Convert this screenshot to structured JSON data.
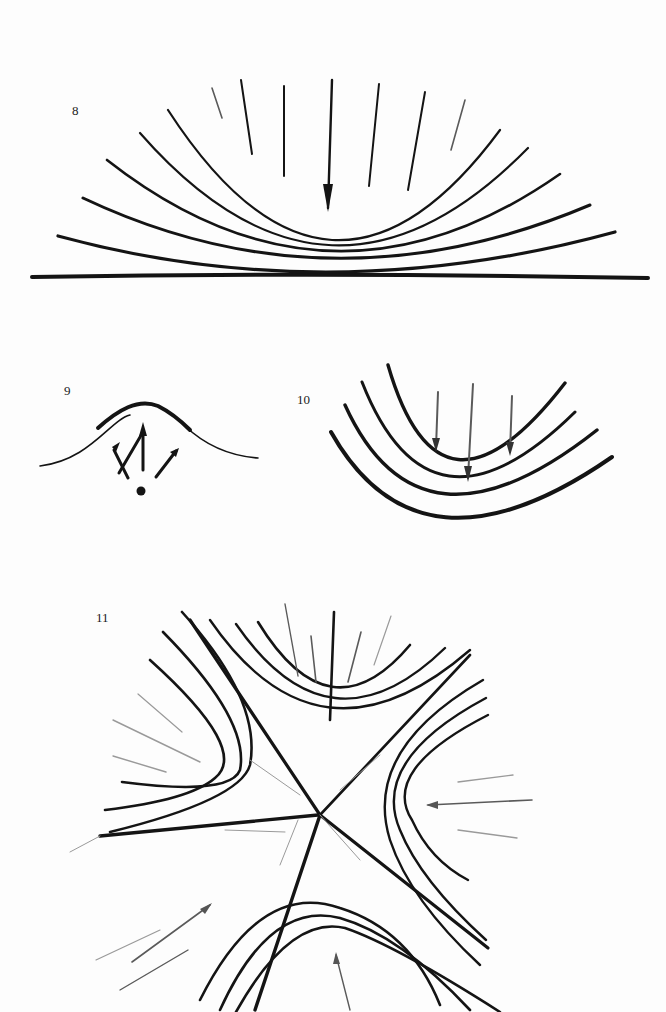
{
  "page": {
    "background": "#fdfdfd",
    "ink_color": "#141414"
  },
  "figures": [
    {
      "id": "fig-8",
      "label": "8",
      "description": "Nested concave-up curves above a horizontal baseline with downward arrows converging from above"
    },
    {
      "id": "fig-9",
      "label": "9",
      "description": "Single hump curve with three arrows radiating upward from a small dot beneath it"
    },
    {
      "id": "fig-10",
      "label": "10",
      "description": "Four nested U-shaped curves with three downward arrows inside"
    },
    {
      "id": "fig-11",
      "label": "11",
      "description": "Saddle-like pattern of four families of hyperbolic curves around a central crossing point, with arrows and faint radial lines"
    }
  ]
}
